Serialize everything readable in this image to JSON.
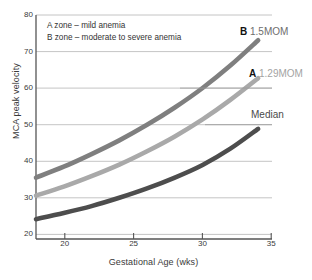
{
  "chart_data": {
    "type": "line",
    "title": "",
    "xlabel": "Gestational Age (wks)",
    "ylabel": "MCA peak velocity",
    "xlim": [
      18,
      35
    ],
    "ylim": [
      18,
      80
    ],
    "xticks": [
      20,
      25,
      30,
      35
    ],
    "yticks": [
      20,
      30,
      40,
      50,
      60,
      70,
      80
    ],
    "grid": true,
    "legend_position": "inline-right-callouts",
    "annotations": [
      "A zone – mild anemia",
      "B zone – moderate to severe anemia"
    ],
    "series": [
      {
        "name": "1.5MOM",
        "tag": "B",
        "color": "#7f7f7f",
        "x": [
          18,
          20,
          22,
          24,
          26,
          28,
          30,
          32,
          34
        ],
        "values": [
          35.0,
          38.0,
          41.5,
          45.3,
          49.6,
          54.4,
          59.8,
          66.0,
          73.0
        ]
      },
      {
        "name": "1.29MOM",
        "tag": "A",
        "color": "#a9a9a9",
        "x": [
          18,
          20,
          22,
          24,
          26,
          28,
          30,
          32,
          34
        ],
        "values": [
          30.0,
          32.5,
          35.4,
          38.6,
          42.3,
          46.4,
          51.1,
          56.5,
          62.5
        ]
      },
      {
        "name": "Median",
        "tag": "",
        "color": "#4d4d4d",
        "x": [
          18,
          20,
          22,
          24,
          26,
          28,
          30,
          32,
          34
        ],
        "values": [
          23.5,
          25.2,
          27.1,
          29.4,
          32.0,
          35.0,
          38.5,
          43.0,
          48.5
        ]
      }
    ]
  },
  "axes": {
    "y_title": "MCA peak velocity",
    "x_title": "Gestational Age (wks)",
    "y_ticks": [
      "80",
      "70",
      "60",
      "50",
      "40",
      "30",
      "20"
    ],
    "x_ticks": [
      "20",
      "25",
      "30",
      "35"
    ]
  },
  "annotation_box": {
    "line1": "A zone – mild anemia",
    "line2": "B zone – moderate to severe anemia"
  },
  "callouts": {
    "b": {
      "tag": "B",
      "value": "1.5MOM"
    },
    "a": {
      "tag": "A",
      "value": "1.29MOM"
    },
    "median": {
      "label": "Median"
    }
  },
  "colors": {
    "b_curve": "#7f7f7f",
    "a_curve": "#a9a9a9",
    "median_curve": "#4d4d4d",
    "axis": "#555555",
    "grid": "#b5b5b5"
  }
}
